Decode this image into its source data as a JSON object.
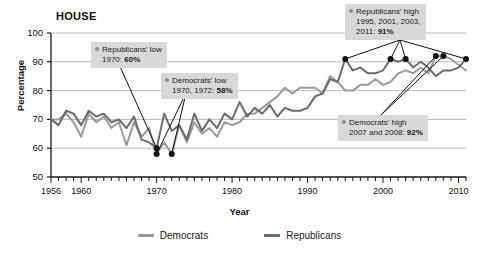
{
  "chart_data": {
    "type": "line",
    "title": "HOUSE",
    "xlabel": "Year",
    "ylabel": "Percentage",
    "ylim": [
      50,
      100
    ],
    "xlim": [
      1956,
      2011
    ],
    "grid": true,
    "legend_position": "bottom",
    "ytick_labels": [
      "100",
      "90",
      "80",
      "70",
      "60",
      "50"
    ],
    "ytick_values": [
      100,
      90,
      80,
      70,
      60,
      50
    ],
    "xtick_labels": [
      "1956",
      "1960",
      "1970",
      "1980",
      "1990",
      "2000",
      "2010"
    ],
    "xtick_values": [
      1956,
      1960,
      1970,
      1980,
      1990,
      2000,
      2010
    ],
    "minor_tick_interval": 1,
    "x": [
      1956,
      1957,
      1958,
      1959,
      1960,
      1961,
      1962,
      1963,
      1964,
      1965,
      1966,
      1967,
      1968,
      1969,
      1970,
      1971,
      1972,
      1973,
      1974,
      1975,
      1976,
      1977,
      1978,
      1979,
      1980,
      1981,
      1982,
      1983,
      1984,
      1985,
      1986,
      1987,
      1988,
      1989,
      1990,
      1991,
      1992,
      1993,
      1994,
      1995,
      1996,
      1997,
      1998,
      1999,
      2000,
      2001,
      2002,
      2003,
      2004,
      2005,
      2006,
      2007,
      2008,
      2009,
      2010,
      2011
    ],
    "series": [
      {
        "name": "Democrats",
        "color": "#9a9a9a",
        "values": [
          70,
          70,
          72,
          69,
          64,
          72,
          69,
          71,
          67,
          69,
          61,
          69,
          64,
          67,
          58,
          62,
          58,
          68,
          62,
          69,
          65,
          67,
          64,
          69,
          68,
          69,
          72,
          72,
          74,
          76,
          78,
          81,
          79,
          81,
          81,
          81,
          79,
          85,
          83,
          80,
          80,
          82,
          82,
          84,
          82,
          83,
          86,
          87,
          86,
          88,
          86,
          92,
          92,
          91,
          89,
          87
        ]
      },
      {
        "name": "Republicans",
        "color": "#6b6b6b",
        "values": [
          70,
          68,
          73,
          72,
          68,
          73,
          71,
          72,
          69,
          70,
          67,
          71,
          63,
          62,
          60,
          72,
          66,
          68,
          63,
          72,
          66,
          70,
          67,
          72,
          70,
          76,
          71,
          74,
          72,
          75,
          71,
          74,
          73,
          73,
          74,
          78,
          79,
          84,
          83,
          91,
          87,
          88,
          86,
          86,
          87,
          91,
          90,
          91,
          88,
          90,
          88,
          85,
          87,
          87,
          88,
          91
        ]
      }
    ],
    "annotations": [
      {
        "id": "republicans-low",
        "line1": "Republicans' low",
        "line2_prefix": "1970: ",
        "line2_value": "60%",
        "points": [
          {
            "year": 1970,
            "value": 60
          }
        ]
      },
      {
        "id": "democrats-low",
        "line1": "Democrats' low",
        "line2_prefix": "1970, 1972: ",
        "line2_value": "58%",
        "points": [
          {
            "year": 1970,
            "value": 58
          },
          {
            "year": 1972,
            "value": 58
          }
        ]
      },
      {
        "id": "republicans-high",
        "line1": "Republicans' high",
        "line2_prefix": "1995, 2001, 2003,",
        "line3_prefix": "2011: ",
        "line3_value": "91%",
        "points": [
          {
            "year": 1995,
            "value": 91
          },
          {
            "year": 2001,
            "value": 91
          },
          {
            "year": 2003,
            "value": 91
          },
          {
            "year": 2011,
            "value": 91
          }
        ]
      },
      {
        "id": "democrats-high",
        "line1": "Democrats' high",
        "line2_prefix": "2007 and 2008: ",
        "line2_value": "92%",
        "points": [
          {
            "year": 2007,
            "value": 92
          },
          {
            "year": 2008,
            "value": 92
          }
        ]
      }
    ]
  },
  "legend": {
    "items": [
      {
        "label": "Democrats",
        "color": "#9a9a9a"
      },
      {
        "label": "Republicans",
        "color": "#6b6b6b"
      }
    ]
  }
}
